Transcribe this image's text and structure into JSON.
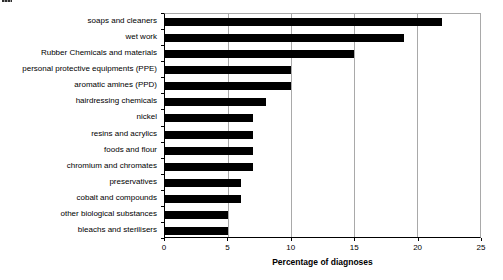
{
  "page": {
    "background": "#ffffff"
  },
  "chart_data": {
    "type": "bar",
    "orientation": "horizontal",
    "title": "",
    "xlabel": "Percentage of diagnoses",
    "ylabel": "",
    "categories": [
      "soaps and cleaners",
      "wet work",
      "Rubber Chemicals and materials",
      "personal protective equipments (PPE)",
      "aromatic amines (PPD)",
      "hairdressing chemicals",
      "nickel",
      "resins and acrylics",
      "foods and flour",
      "chromium and chromates",
      "preservatives",
      "cobalt and compounds",
      "other biological substances",
      "bleachs and sterilisers"
    ],
    "values": [
      22,
      19,
      15,
      10,
      10,
      8,
      7,
      7,
      7,
      7,
      6,
      6,
      5,
      5
    ],
    "xlim": [
      0,
      25
    ],
    "xticks": [
      0,
      5,
      10,
      15,
      20,
      25
    ],
    "grid": true,
    "legend": false,
    "colors": {
      "bar": "#000000",
      "gridline": "#a9a9a9",
      "plot_border": "#a9a9a9",
      "axis": "#000000",
      "text": "#000000"
    }
  }
}
